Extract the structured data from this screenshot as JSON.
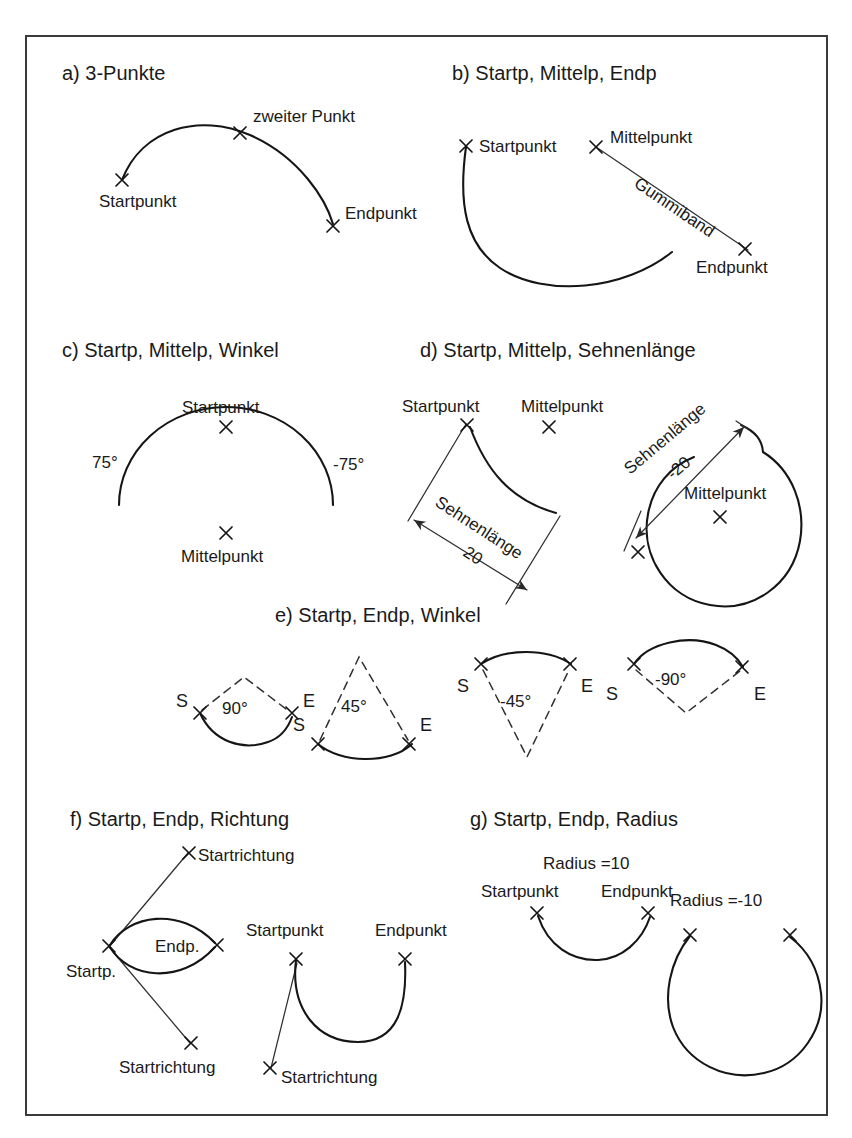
{
  "figure": {
    "background": "#ffffff",
    "ink": "#151515",
    "frame_color": "#3a3a3a"
  },
  "panels": [
    {
      "id": "a",
      "title": "a) 3-Punkte",
      "labels": [
        "zweiter Punkt",
        "Startpunkt",
        "Endpunkt"
      ]
    },
    {
      "id": "b",
      "title": "b) Startp, Mittelp, Endp",
      "labels": [
        "Startpunkt",
        "Mittelpunkt",
        "Gummiband",
        "Endpunkt"
      ]
    },
    {
      "id": "c",
      "title": "c) Startp, Mittelp, Winkel",
      "labels": [
        "Startpunkt",
        "75°",
        "-75°",
        "Mittelpunkt"
      ]
    },
    {
      "id": "d",
      "title": "d) Startp, Mittelp, Sehnenlänge",
      "labels": [
        "Startpunkt",
        "Mittelpunkt",
        "Sehnenlänge",
        "20",
        "Sehnenlänge",
        "-20",
        "Mittelpunkt"
      ]
    },
    {
      "id": "e",
      "title": "e) Startp, Endp, Winkel",
      "labels": [
        "S",
        "90°",
        "E",
        "S",
        "45°",
        "E",
        "S",
        "-45°",
        "E",
        "S",
        "-90°",
        "E"
      ]
    },
    {
      "id": "f",
      "title": "f) Startp, Endp, Richtung",
      "labels": [
        "Startrichtung",
        "Startp.",
        "Endp.",
        "Startrichtung",
        "Startpunkt",
        "Endpunkt",
        "Startrichtung"
      ]
    },
    {
      "id": "g",
      "title": "g) Startp, Endp, Radius",
      "labels": [
        "Radius =10",
        "Startpunkt",
        "Endpunkt",
        "Radius =-10"
      ]
    }
  ],
  "panel_a": {
    "title": "a) 3-Punkte",
    "start_label": "Startpunkt",
    "mid_label": "zweiter Punkt",
    "end_label": "Endpunkt"
  },
  "panel_b": {
    "title": "b) Startp, Mittelp, Endp",
    "start_label": "Startpunkt",
    "center_label": "Mittelpunkt",
    "band_label": "Gummiband",
    "end_label": "Endpunkt"
  },
  "panel_c": {
    "title": "c) Startp, Mittelp, Winkel",
    "start_label": "Startpunkt",
    "angle_pos": "75°",
    "angle_neg": "-75°",
    "center_label": "Mittelpunkt"
  },
  "panel_d": {
    "title": "d) Startp, Mittelp, Sehnenlänge",
    "left": {
      "start_label": "Startpunkt",
      "center_label": "Mittelpunkt",
      "chord_label": "Sehnenlänge",
      "chord_value": "20"
    },
    "right": {
      "chord_label": "Sehnenlänge",
      "chord_value": "-20",
      "center_label": "Mittelpunkt"
    }
  },
  "panel_e": {
    "title": "e) Startp, Endp, Winkel",
    "items": [
      {
        "s": "S",
        "e": "E",
        "angle": "90°"
      },
      {
        "s": "S",
        "e": "E",
        "angle": "45°"
      },
      {
        "s": "S",
        "e": "E",
        "angle": "-45°"
      },
      {
        "s": "S",
        "e": "E",
        "angle": "-90°"
      }
    ]
  },
  "panel_f": {
    "title": "f) Startp, Endp, Richtung",
    "left": {
      "dir_top_label": "Startrichtung",
      "start_label": "Startp.",
      "end_label": "Endp.",
      "dir_bottom_label": "Startrichtung"
    },
    "right": {
      "start_label": "Startpunkt",
      "end_label": "Endpunkt",
      "dir_label": "Startrichtung"
    }
  },
  "panel_g": {
    "title": "g) Startp, Endp, Radius",
    "left": {
      "radius_label": "Radius =10",
      "start_label": "Startpunkt",
      "end_label": "Endpunkt"
    },
    "right": {
      "radius_label": "Radius =-10"
    }
  }
}
